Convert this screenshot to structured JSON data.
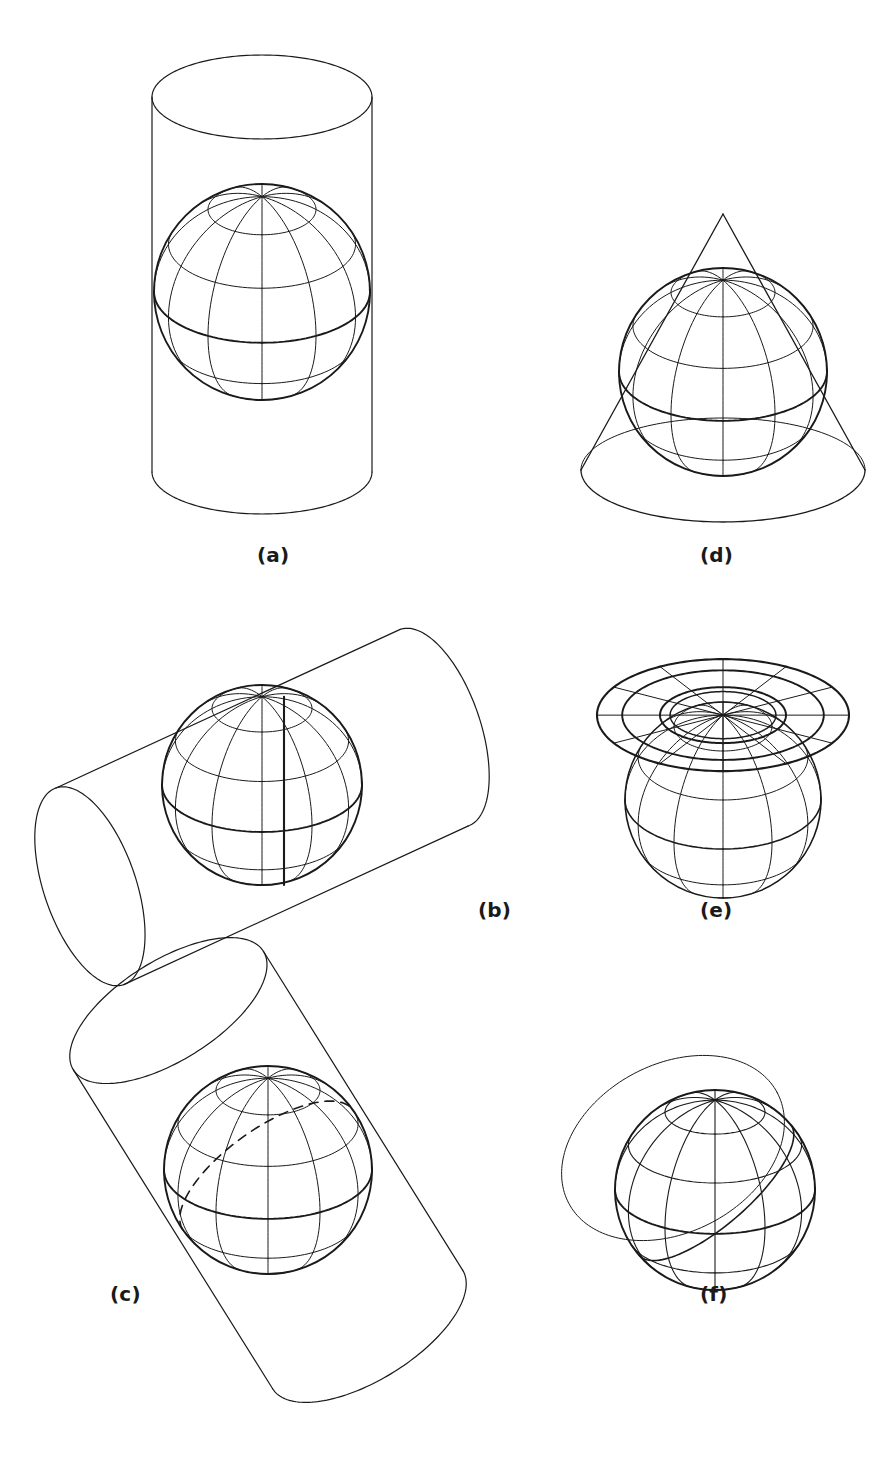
{
  "figure": {
    "background_color": "#ffffff",
    "line_color": "#1a1a1a",
    "panel_count": 6,
    "width": 884,
    "height": 1471
  },
  "panels": [
    {
      "id": "a",
      "label": "(a)",
      "surface": "cylinder",
      "aspect": "normal",
      "description": "Vertical cylinder tangent to the globe along the equator",
      "tangency": "equator"
    },
    {
      "id": "b",
      "label": "(b)",
      "surface": "cylinder",
      "aspect": "transverse",
      "description": "Horizontal cylinder tangent to the globe along a meridian",
      "tangency": "meridian"
    },
    {
      "id": "c",
      "label": "(c)",
      "surface": "cylinder",
      "aspect": "oblique",
      "description": "Tilted cylinder tangent to the globe along an oblique great circle",
      "tangency": "oblique great circle"
    },
    {
      "id": "d",
      "label": "(d)",
      "surface": "cone",
      "aspect": "normal",
      "description": "Cone tangent to the globe along a standard parallel",
      "tangency": "standard parallel"
    },
    {
      "id": "e",
      "label": "(e)",
      "surface": "plane",
      "aspect": "polar",
      "description": "Plane tangent to the globe at the pole",
      "tangency": "north pole"
    },
    {
      "id": "f",
      "label": "(f)",
      "surface": "plane",
      "aspect": "oblique",
      "description": "Plane tangent to the globe at an oblique point",
      "tangency": "oblique point"
    }
  ],
  "globe": {
    "graticule": {
      "meridian_interval_deg": 30,
      "parallel_interval_deg": 30,
      "meridian_count": 12,
      "parallel_labels": [
        "60N",
        "30N",
        "0",
        "30S",
        "60S"
      ],
      "emphasized": [
        "equator",
        "outline"
      ],
      "view_tilt_deg": 62
    }
  },
  "chart_data": {
    "type": "diagram",
    "categories": [
      "(a)",
      "(b)",
      "(c)",
      "(d)",
      "(e)",
      "(f)"
    ],
    "series": [
      {
        "name": "surface",
        "values": [
          "cylinder",
          "cylinder",
          "cylinder",
          "cone",
          "plane",
          "plane"
        ]
      },
      {
        "name": "aspect",
        "values": [
          "normal",
          "transverse",
          "oblique",
          "normal",
          "polar",
          "oblique"
        ]
      }
    ],
    "xlabel": "",
    "ylabel": "",
    "grid": false,
    "legend": "none"
  }
}
